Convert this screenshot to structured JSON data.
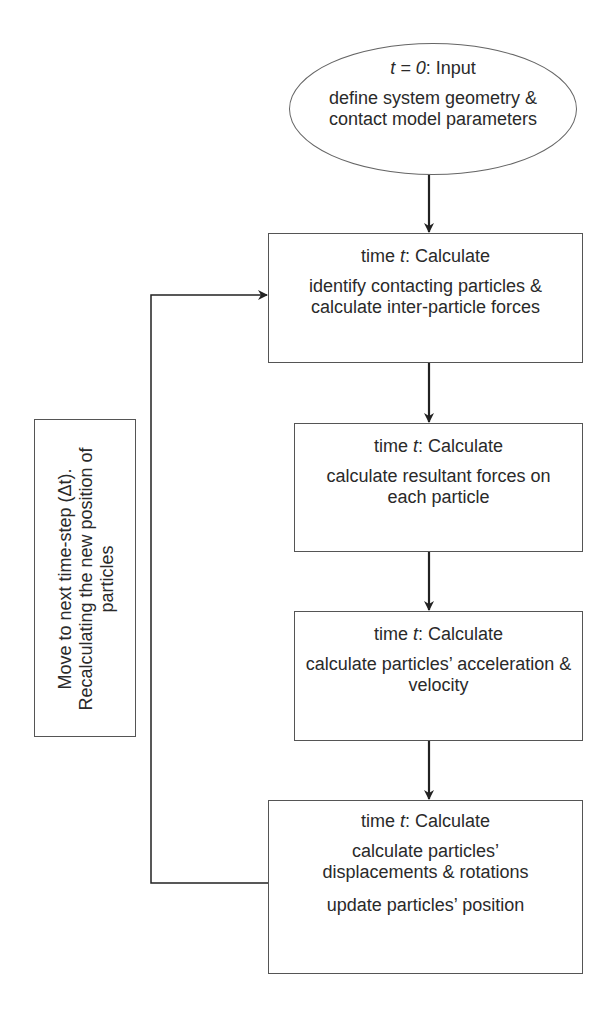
{
  "diagram": {
    "type": "flowchart",
    "start": {
      "title_var": "t = 0",
      "title_rest": ": Input",
      "text": "define system geometry & contact model parameters",
      "text_lines": [
        "define system geometry &",
        "contact model parameters"
      ]
    },
    "steps": [
      {
        "title_prefix": "time ",
        "title_var": "t",
        "title_rest": ": Calculate",
        "paragraphs": [
          "identify contacting particles & calculate inter-particle forces"
        ]
      },
      {
        "title_prefix": "time ",
        "title_var": "t",
        "title_rest": ": Calculate",
        "paragraphs": [
          "calculate resultant forces on each particle"
        ]
      },
      {
        "title_prefix": "time ",
        "title_var": "t",
        "title_rest": ": Calculate",
        "paragraphs": [
          "calculate particles’ acceleration & velocity"
        ]
      },
      {
        "title_prefix": "time ",
        "title_var": "t",
        "title_rest": ": Calculate",
        "paragraphs": [
          "calculate particles’ displacements & rotations",
          "update particles’ position"
        ]
      }
    ],
    "loop_label": "Move to next time-step (Δt). Recalculating the new position of particles",
    "edges": [
      {
        "from": "start",
        "to": "step-1"
      },
      {
        "from": "step-1",
        "to": "step-2"
      },
      {
        "from": "step-2",
        "to": "step-3"
      },
      {
        "from": "step-3",
        "to": "step-4"
      },
      {
        "from": "step-4",
        "to": "step-1",
        "label": "loop"
      }
    ],
    "colors": {
      "line": "#222222",
      "border": "#555555",
      "text": "#2a2a2a"
    }
  }
}
